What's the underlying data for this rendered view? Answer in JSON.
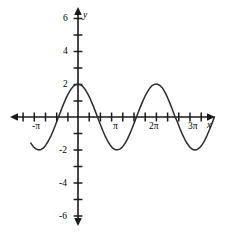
{
  "chart_data": {
    "type": "line",
    "title": "",
    "xlabel": "x",
    "ylabel": "y",
    "function": "y = 2 cos(x)",
    "amplitude": 2,
    "period": "2π",
    "xlim": [
      -4.5,
      12.2
    ],
    "ylim": [
      -7.2,
      7.2
    ],
    "grid": false,
    "legend": null,
    "x_axis": {
      "name": "x",
      "tick_labels": [
        "-π",
        "π",
        "2π",
        "3π"
      ],
      "tick_values": [
        -3.1416,
        3.1416,
        6.2832,
        9.4248
      ],
      "tick_spacing": "π/3.5",
      "arrows": "both"
    },
    "y_axis": {
      "name": "y",
      "tick_labels": [
        "6",
        "4",
        "2",
        "-2",
        "-4",
        "-6"
      ],
      "tick_values": [
        6,
        4,
        2,
        -2,
        -4,
        -6
      ],
      "tick_spacing": 1,
      "arrows": "both"
    },
    "series": [
      {
        "name": "2cos(x)",
        "color": "#2b2b2b",
        "x": [
          -3.8,
          -3.6,
          -3.4,
          -3.2,
          -3.0,
          -2.8,
          -2.6,
          -2.4,
          -2.2,
          -2.0,
          -1.8,
          -1.6,
          -1.4,
          -1.2,
          -1.0,
          -0.8,
          -0.6,
          -0.4,
          -0.2,
          0.0,
          0.2,
          0.4,
          0.6,
          0.8,
          1.0,
          1.2,
          1.4,
          1.6,
          1.8,
          2.0,
          2.2,
          2.4,
          2.6,
          2.8,
          3.0,
          3.2,
          3.4,
          3.6,
          3.8,
          4.0,
          4.2,
          4.4,
          4.6,
          4.8,
          5.0,
          5.2,
          5.4,
          5.6,
          5.8,
          6.0,
          6.2,
          6.4,
          6.6,
          6.8,
          7.0,
          7.2,
          7.4,
          7.6,
          7.8,
          8.0,
          8.2,
          8.4,
          8.6,
          8.8,
          9.0,
          9.2,
          9.4,
          9.6,
          9.8,
          10.0,
          10.2,
          10.4,
          10.6,
          10.8,
          11.0
        ],
        "y": [
          -1.58,
          -1.8,
          -1.93,
          -1.99,
          -1.98,
          -1.89,
          -1.71,
          -1.47,
          -1.18,
          -0.83,
          -0.45,
          -0.06,
          0.34,
          0.72,
          1.08,
          1.39,
          1.65,
          1.84,
          1.96,
          2.0,
          1.96,
          1.84,
          1.65,
          1.39,
          1.08,
          0.72,
          0.34,
          -0.06,
          -0.45,
          -0.83,
          -1.18,
          -1.47,
          -1.71,
          -1.89,
          -1.98,
          -1.99,
          -1.93,
          -1.8,
          -1.58,
          -1.31,
          -0.98,
          -0.61,
          -0.22,
          0.18,
          0.57,
          0.93,
          1.26,
          1.54,
          1.77,
          1.92,
          1.99,
          1.99,
          1.91,
          1.76,
          1.51,
          1.2,
          0.84,
          0.45,
          0.05,
          -0.29,
          -0.68,
          -1.04,
          -1.35,
          -1.61,
          -1.82,
          -1.95,
          -2.0,
          -1.97,
          -1.86,
          -1.68,
          -1.43,
          -1.11,
          -0.76,
          -0.37,
          0.01
        ]
      }
    ]
  },
  "axis_labels": {
    "x": "x",
    "y": "y",
    "x_ticks": [
      {
        "text": "-π"
      },
      {
        "text": "π"
      },
      {
        "text": "2π"
      },
      {
        "text": "3π"
      }
    ],
    "y_ticks": [
      {
        "text": "6"
      },
      {
        "text": "4"
      },
      {
        "text": "2"
      },
      {
        "text": "-2"
      },
      {
        "text": "-4"
      },
      {
        "text": "-6"
      }
    ]
  },
  "colors": {
    "curve": "#2b2b2b",
    "axis": "#1a1a1a",
    "background": "#ffffff"
  }
}
